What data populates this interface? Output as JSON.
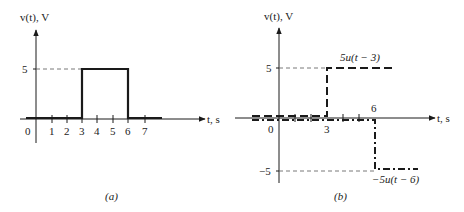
{
  "figure_a": {
    "caption": "(a)",
    "y_label": "v(t), V",
    "x_label": "t, s",
    "y_ticks": [
      {
        "value": 5,
        "label": "5"
      }
    ],
    "x_ticks": [
      "0",
      "1",
      "2",
      "3",
      "4",
      "5",
      "6",
      "7"
    ],
    "signal": "rectangular pulse: v = 5 V for 3 < t < 6 s, else 0"
  },
  "figure_b": {
    "caption": "(b)",
    "y_label": "v(t), V",
    "x_label": "t, s",
    "y_ticks": [
      {
        "value": 5,
        "label": "5"
      },
      {
        "value": -5,
        "label": "−5"
      }
    ],
    "x_ticks": [
      {
        "value": 0,
        "label": "0"
      },
      {
        "value": 3,
        "label": "3"
      },
      {
        "value": 6,
        "label": "6"
      }
    ],
    "components": [
      {
        "label": "5u(t − 3)",
        "style": "dashed",
        "step_at": 3,
        "amplitude": 5
      },
      {
        "label": "−5u(t − 6)",
        "style": "dash-dot",
        "step_at": 6,
        "amplitude": -5
      }
    ]
  },
  "colors": {
    "ink": "#1a1a1a",
    "guide": "#555555",
    "background": "#ffffff"
  }
}
